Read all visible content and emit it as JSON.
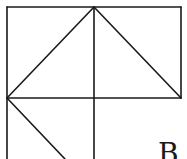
{
  "diagram": {
    "stroke_color": "#1a1a1a",
    "background": "#ffffff",
    "labels": [
      {
        "id": "point-label",
        "text": "B",
        "x": 158,
        "y": 140
      }
    ],
    "segments": [
      {
        "id": "top-edge",
        "x1": 7,
        "y1": 7,
        "x2": 181,
        "y2": 7
      },
      {
        "id": "right-edge",
        "x1": 181,
        "y1": 7,
        "x2": 181,
        "y2": 98
      },
      {
        "id": "middle-horizontal",
        "x1": 7,
        "y1": 98,
        "x2": 181,
        "y2": 98
      },
      {
        "id": "left-edge",
        "x1": 7,
        "y1": 7,
        "x2": 7,
        "y2": 159
      },
      {
        "id": "center-vertical",
        "x1": 94,
        "y1": 7,
        "x2": 94,
        "y2": 159
      },
      {
        "id": "left-diagonal",
        "x1": 7,
        "y1": 98,
        "x2": 94,
        "y2": 7
      },
      {
        "id": "right-diagonal",
        "x1": 94,
        "y1": 7,
        "x2": 181,
        "y2": 98
      },
      {
        "id": "lower-diagonal",
        "x1": 7,
        "y1": 98,
        "x2": 65,
        "y2": 159
      }
    ]
  }
}
